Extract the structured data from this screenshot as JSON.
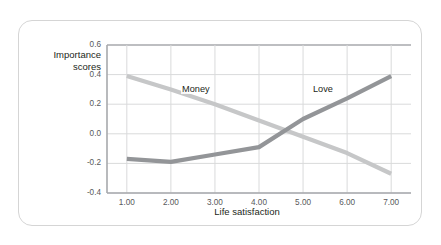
{
  "chart_data": {
    "type": "line",
    "title": "",
    "subtitle": "",
    "xlabel": "Life satisfaction",
    "ylabel": "Importance\nscores",
    "ylabel_lines": [
      "Importance",
      "scores"
    ],
    "x": [
      1,
      2,
      3,
      4,
      5,
      6,
      7
    ],
    "xtick_labels": [
      "1.00",
      "2.00",
      "3.00",
      "4.00",
      "5.00",
      "6.00",
      "7.00"
    ],
    "ytick_labels": [
      "0.6",
      "0.4",
      "0.2",
      "0.0",
      "-0.2",
      "-0.4"
    ],
    "yticks": [
      0.6,
      0.4,
      0.2,
      0.0,
      -0.2,
      -0.4
    ],
    "xlim": [
      0.55,
      7.45
    ],
    "ylim": [
      -0.4,
      0.6
    ],
    "grid": true,
    "legend_position": "inline-annotations",
    "series": [
      {
        "name": "Money",
        "color": "#c6c7c8",
        "values": [
          0.39,
          0.3,
          0.2,
          0.09,
          -0.02,
          -0.13,
          -0.27
        ],
        "label_x": 2.55,
        "label_y": 0.295
      },
      {
        "name": "Love",
        "color": "#939598",
        "values": [
          -0.17,
          -0.19,
          -0.14,
          -0.09,
          0.1,
          0.24,
          0.39
        ],
        "label_x": 5.52,
        "label_y": 0.295
      }
    ],
    "annotations": [
      "Money",
      "Love"
    ],
    "axis_color": "#a7a9ac",
    "grid_color": "#d9dadb",
    "tick_text_color": "#58595b",
    "title_text_color": "#231f20",
    "card_border_color": "#d5d5d5",
    "background_color": "#ffffff"
  }
}
